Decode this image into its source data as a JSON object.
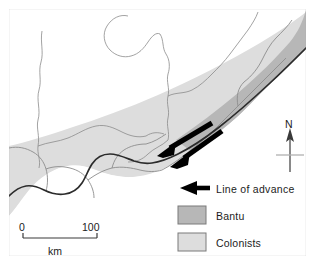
{
  "map": {
    "title": "Bantu and Colonist advance map",
    "frame": {
      "x": 8,
      "y": 8,
      "width": 299,
      "height": 249
    },
    "background_color": "#ffffff",
    "frame_color": "#9a9a9a",
    "coastline_color": "#2b2b2b",
    "border_color": "#8c8c8c",
    "river_color": "#8c8c8c"
  },
  "regions": [
    {
      "key": "bantu",
      "label": "Bantu",
      "color": "#b7b7b7"
    },
    {
      "key": "colonists",
      "label": "Colonists",
      "color": "#dddddd"
    }
  ],
  "arrows": {
    "color": "#000000",
    "direction": "southwest",
    "count": 2,
    "meaning": "Line of advance"
  },
  "north_arrow": {
    "label": "N",
    "color": "#4a4a4a"
  },
  "scale_bar": {
    "min_label": "0",
    "max_label": "100",
    "unit_label": "km",
    "color": "#3a3a3a"
  },
  "legend": {
    "items": [
      {
        "key": "line-of-advance",
        "label": "Line of advance",
        "symbol": "arrow-left",
        "color": "#000000"
      },
      {
        "key": "bantu",
        "label": "Bantu",
        "symbol": "swatch",
        "color": "#b7b7b7"
      },
      {
        "key": "colonists",
        "label": "Colonists",
        "symbol": "swatch",
        "color": "#dddddd"
      }
    ]
  }
}
